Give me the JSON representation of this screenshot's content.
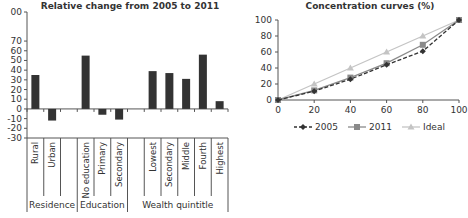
{
  "chart_data": [
    {
      "type": "bar",
      "title": "Relative change from 2005 to 2011",
      "ylim": [
        -30,
        100
      ],
      "yticks": [
        "00",
        "70",
        "60",
        "50",
        "40",
        "30",
        "20",
        "10",
        "0",
        "-10",
        "-20",
        "-30"
      ],
      "categories": [
        "Rural",
        "Urban",
        "",
        "No education",
        "Primary",
        "Secondary",
        "",
        "Lowest",
        "Secondary",
        "Middle",
        "Fourth",
        "Highest"
      ],
      "values": [
        35,
        -12,
        null,
        55,
        -6,
        -11,
        null,
        39,
        37,
        31,
        56,
        8
      ],
      "groups": [
        {
          "label": "Residence",
          "span": 3
        },
        {
          "label": "Education",
          "span": 3
        },
        {
          "label": "Wealth quintitle",
          "span": 6
        }
      ],
      "bar_color": "#333333"
    },
    {
      "type": "line",
      "title": "Concentration curves (%)",
      "x": [
        0,
        20,
        40,
        60,
        80,
        100
      ],
      "xticks": [
        "0",
        "20",
        "40",
        "60",
        "80",
        "100"
      ],
      "yticks": [
        "0",
        "20",
        "40",
        "60",
        "80",
        "100"
      ],
      "xlim": [
        0,
        100
      ],
      "ylim": [
        0,
        100
      ],
      "series": [
        {
          "name": "2005",
          "values": [
            0,
            11,
            26,
            44,
            61,
            100
          ],
          "color": "#333333",
          "dash": true,
          "marker": "diamond"
        },
        {
          "name": "2011",
          "values": [
            0,
            12,
            28,
            46,
            69,
            100
          ],
          "color": "#8a8a8a",
          "dash": false,
          "marker": "square"
        },
        {
          "name": "Ideal",
          "values": [
            0,
            20,
            40,
            60,
            80,
            100
          ],
          "color": "#c4c4c4",
          "dash": false,
          "marker": "triangle"
        }
      ],
      "legend_position": "bottom"
    }
  ]
}
